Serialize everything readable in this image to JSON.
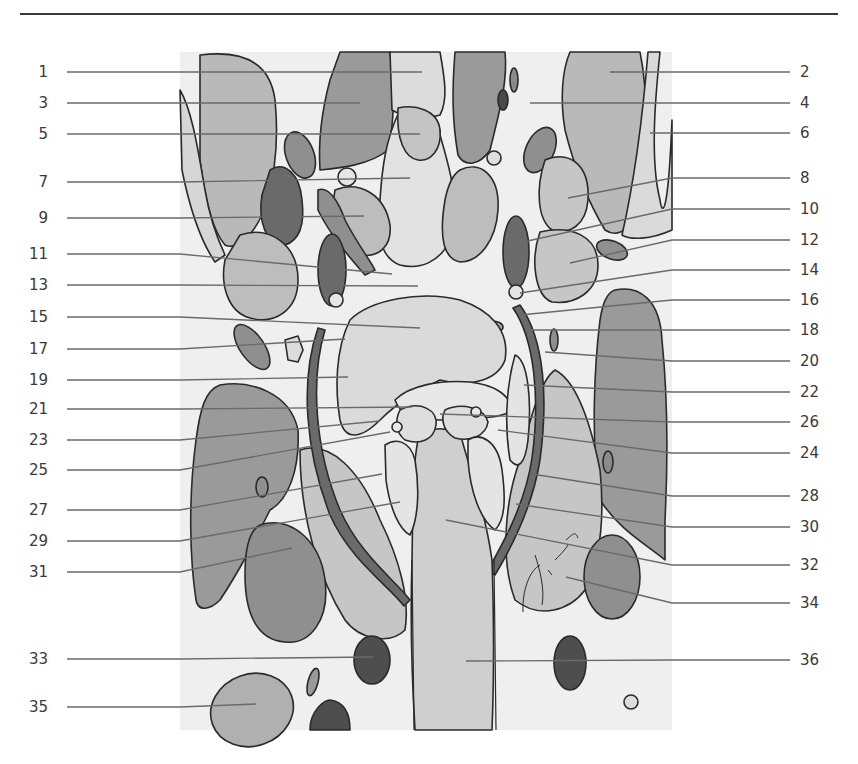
{
  "figure": {
    "type": "anatomical-illustration",
    "view": "coronal section, grayscale labeled diagram",
    "signature": "Spitzer",
    "colors": {
      "background": "#ffffff",
      "panel": "#eeeeee",
      "outline": "#2a2a2a",
      "leader_line": "#6a6a6a",
      "label_text": "#3a3a3a",
      "light_tissue": "#dcdcdc",
      "mid_tissue": "#b8b8b8",
      "dark_tissue": "#8f8f8f",
      "vessel": "#5e5e5e"
    }
  },
  "header": {
    "rule": true
  },
  "labels": {
    "left": [
      {
        "num": "1",
        "y": 72,
        "tx": 422,
        "ty": 72
      },
      {
        "num": "3",
        "y": 103,
        "tx": 360,
        "ty": 103
      },
      {
        "num": "5",
        "y": 134,
        "tx": 420,
        "ty": 134
      },
      {
        "num": "7",
        "y": 182,
        "tx": 410,
        "ty": 178
      },
      {
        "num": "9",
        "y": 218,
        "tx": 364,
        "ty": 216
      },
      {
        "num": "11",
        "y": 254,
        "tx": 392,
        "ty": 274
      },
      {
        "num": "13",
        "y": 285,
        "tx": 418,
        "ty": 286
      },
      {
        "num": "15",
        "y": 317,
        "tx": 420,
        "ty": 328
      },
      {
        "num": "17",
        "y": 349,
        "tx": 345,
        "ty": 339
      },
      {
        "num": "19",
        "y": 380,
        "tx": 348,
        "ty": 377
      },
      {
        "num": "21",
        "y": 409,
        "tx": 412,
        "ty": 407
      },
      {
        "num": "23",
        "y": 440,
        "tx": 380,
        "ty": 421
      },
      {
        "num": "25",
        "y": 470,
        "tx": 390,
        "ty": 432
      },
      {
        "num": "27",
        "y": 510,
        "tx": 382,
        "ty": 474
      },
      {
        "num": "29",
        "y": 541,
        "tx": 400,
        "ty": 502
      },
      {
        "num": "31",
        "y": 572,
        "tx": 292,
        "ty": 548
      },
      {
        "num": "33",
        "y": 659,
        "tx": 373,
        "ty": 657
      },
      {
        "num": "35",
        "y": 707,
        "tx": 256,
        "ty": 704
      }
    ],
    "right": [
      {
        "num": "2",
        "y": 72,
        "tx": 610,
        "ty": 72
      },
      {
        "num": "4",
        "y": 103,
        "tx": 530,
        "ty": 103
      },
      {
        "num": "6",
        "y": 133,
        "tx": 650,
        "ty": 133
      },
      {
        "num": "8",
        "y": 178,
        "tx": 568,
        "ty": 198
      },
      {
        "num": "10",
        "y": 209,
        "tx": 514,
        "ty": 244
      },
      {
        "num": "12",
        "y": 240,
        "tx": 570,
        "ty": 263
      },
      {
        "num": "14",
        "y": 270,
        "tx": 520,
        "ty": 293
      },
      {
        "num": "16",
        "y": 300,
        "tx": 520,
        "ty": 315
      },
      {
        "num": "18",
        "y": 330,
        "tx": 530,
        "ty": 330
      },
      {
        "num": "20",
        "y": 361,
        "tx": 545,
        "ty": 352
      },
      {
        "num": "22",
        "y": 392,
        "tx": 524,
        "ty": 385
      },
      {
        "num": "26",
        "y": 422,
        "tx": 440,
        "ty": 414
      },
      {
        "num": "24",
        "y": 453,
        "tx": 498,
        "ty": 430
      },
      {
        "num": "28",
        "y": 496,
        "tx": 532,
        "ty": 474
      },
      {
        "num": "30",
        "y": 527,
        "tx": 516,
        "ty": 504
      },
      {
        "num": "32",
        "y": 565,
        "tx": 446,
        "ty": 520
      },
      {
        "num": "34",
        "y": 603,
        "tx": 566,
        "ty": 577
      },
      {
        "num": "36",
        "y": 660,
        "tx": 466,
        "ty": 661
      }
    ]
  },
  "layout": {
    "left_text_x": 8,
    "left_line_start": 67,
    "right_line_end": 790,
    "right_text_x": 800
  }
}
